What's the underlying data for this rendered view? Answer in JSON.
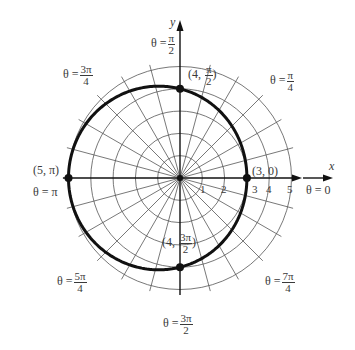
{
  "chart_data": {
    "type": "polar",
    "title": "",
    "equation": "r = 4 - cos θ",
    "curve": {
      "a": 4,
      "b": -1,
      "description": "limaçon r = 4 − cos θ",
      "color": "#111111",
      "stroke_width": 3
    },
    "grid": {
      "circle_radii": [
        1,
        2,
        3,
        4,
        5
      ],
      "radial_step_deg": 15,
      "color": "#555555"
    },
    "axes": {
      "x_label": "x",
      "y_label": "y",
      "r_ticks": [
        "1",
        "2",
        "3",
        "4",
        "5"
      ]
    },
    "points": [
      {
        "r": 3,
        "theta": 0,
        "label": "(3, 0)"
      },
      {
        "r": 4,
        "theta": 1.5708,
        "label_prefix": "(4, ",
        "label_num": "π",
        "label_den": "2",
        "label_suffix": ")"
      },
      {
        "r": 5,
        "theta": 3.1416,
        "label": "(5, π)"
      },
      {
        "r": 4,
        "theta": 4.7124,
        "label_prefix": "(4, ",
        "label_num": "3π",
        "label_den": "2",
        "label_suffix": ")"
      }
    ],
    "angle_labels": [
      {
        "theta": "0",
        "text": "θ = 0"
      },
      {
        "theta": "π/4",
        "num": "π",
        "den": "4"
      },
      {
        "theta": "π/2",
        "num": "π",
        "den": "2"
      },
      {
        "theta": "3π/4",
        "num": "3π",
        "den": "4"
      },
      {
        "theta": "π",
        "text": "θ = π"
      },
      {
        "theta": "5π/4",
        "num": "5π",
        "den": "4"
      },
      {
        "theta": "3π/2",
        "num": "3π",
        "den": "2"
      },
      {
        "theta": "7π/4",
        "num": "7π",
        "den": "4"
      }
    ]
  },
  "layout": {
    "cx": 180,
    "cy": 178,
    "unit_px": 22.3,
    "grid_extent_units": 5.25
  },
  "labels": {
    "theta_sym": "θ =",
    "theta_0": "θ = 0",
    "theta_pi": "θ = π",
    "x": "x",
    "y": "y",
    "pt_3_0": "(3, 0)",
    "pt_5_pi": "(5, π)",
    "pt_4_prefix": "(4,",
    "pt_close": ")",
    "pi": "π",
    "two": "2",
    "four": "4",
    "three_pi": "3π",
    "five_pi": "5π",
    "seven_pi": "7π",
    "tick_1": "1",
    "tick_2": "2",
    "tick_3": "3",
    "tick_4": "4",
    "tick_5": "5"
  }
}
